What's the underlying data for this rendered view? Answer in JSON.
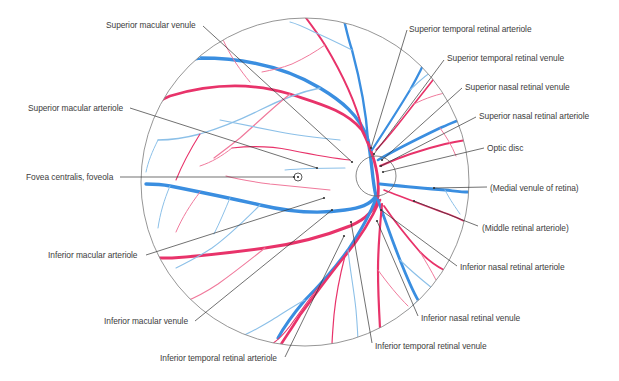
{
  "figure": {
    "fundus": {
      "cx": 305,
      "cy": 182,
      "r": 164,
      "stroke": "#8a8a8a"
    },
    "optic_disc": {
      "cx": 376,
      "cy": 176,
      "r": 20
    },
    "fovea": {
      "cx": 298,
      "cy": 177,
      "r": 4
    },
    "colors": {
      "arteriole": "#e8336a",
      "venule": "#3a8ee0",
      "venule_light": "#8cc0e8",
      "arteriole_light": "#f07a9c",
      "label_text": "#3d3d3d",
      "leader_line": "#333333"
    }
  },
  "labels": [
    {
      "id": "superior-macular-venule",
      "text": "Superior macular venule",
      "x": 106,
      "y": 20,
      "line": [
        [
          203,
          26
        ],
        [
          352,
          162
        ]
      ]
    },
    {
      "id": "superior-macular-arteriole",
      "text": "Superior macular arteriole",
      "x": 28,
      "y": 103,
      "line": [
        [
          130,
          108
        ],
        [
          317,
          168
        ]
      ]
    },
    {
      "id": "fovea-centralis",
      "text": "Fovea centralis, foveola",
      "x": 26,
      "y": 172,
      "line": [
        [
          120,
          177
        ],
        [
          294,
          177
        ]
      ]
    },
    {
      "id": "inferior-macular-arteriole",
      "text": "Inferior macular arteriole",
      "x": 48,
      "y": 250,
      "line": [
        [
          146,
          255
        ],
        [
          324,
          198
        ]
      ]
    },
    {
      "id": "inferior-macular-venule",
      "text": "Inferior macular venule",
      "x": 104,
      "y": 316,
      "line": [
        [
          195,
          321
        ],
        [
          332,
          210
        ]
      ]
    },
    {
      "id": "inferior-temporal-retinal-arteriole",
      "text": "Inferior temporal retinal arteriole",
      "x": 160,
      "y": 353,
      "line": [
        [
          285,
          357
        ],
        [
          344,
          236
        ]
      ]
    },
    {
      "id": "superior-temporal-retinal-arteriole",
      "text": "Superior temporal retinal arteriole",
      "x": 409,
      "y": 24,
      "line": [
        [
          407,
          30
        ],
        [
          371,
          148
        ]
      ]
    },
    {
      "id": "superior-temporal-retinal-venule",
      "text": "Superior temporal retinal venule",
      "x": 447,
      "y": 53,
      "line": [
        [
          444,
          60
        ],
        [
          374,
          154
        ]
      ]
    },
    {
      "id": "superior-nasal-retinal-venule",
      "text": "Superior nasal retinal venule",
      "x": 465,
      "y": 82,
      "line": [
        [
          462,
          88
        ],
        [
          382,
          160
        ]
      ]
    },
    {
      "id": "superior-nasal-retinal-arteriole",
      "text": "Superior nasal retinal arteriole",
      "x": 479,
      "y": 111,
      "line": [
        [
          476,
          117
        ],
        [
          381,
          166
        ]
      ]
    },
    {
      "id": "optic-disc",
      "text": "Optic disc",
      "x": 487,
      "y": 143,
      "line": [
        [
          484,
          148
        ],
        [
          383,
          172
        ]
      ]
    },
    {
      "id": "medial-venule-of-retina",
      "text": "(Medial venule of retina)",
      "x": 490,
      "y": 183,
      "line": [
        [
          487,
          187
        ],
        [
          434,
          188
        ]
      ]
    },
    {
      "id": "middle-retinal-arteriole",
      "text": "(Middle retinal arteriole)",
      "x": 482,
      "y": 223,
      "line": [
        [
          478,
          226
        ],
        [
          414,
          201
        ]
      ]
    },
    {
      "id": "inferior-nasal-retinal-arteriole",
      "text": "Inferior nasal retinal arteriole",
      "x": 460,
      "y": 262,
      "line": [
        [
          457,
          266
        ],
        [
          381,
          210
        ]
      ]
    },
    {
      "id": "inferior-nasal-retinal-venule",
      "text": "Inferior nasal retinal venule",
      "x": 421,
      "y": 313,
      "line": [
        [
          418,
          316
        ],
        [
          377,
          221
        ]
      ]
    },
    {
      "id": "inferior-temporal-retinal-venule",
      "text": "Inferior temporal retinal venule",
      "x": 375,
      "y": 341,
      "line": [
        [
          372,
          343
        ],
        [
          351,
          222
        ]
      ]
    }
  ],
  "vessels": [
    {
      "kind": "venule",
      "w": 3.4,
      "d": "M376 196 C372 180 372 160 368 140 C360 115 340 100 320 88 C290 70 250 58 200 58 C180 60 165 66 152 72"
    },
    {
      "kind": "arteriole",
      "w": 2.8,
      "d": "M378 196 C380 175 372 150 362 130 C345 110 320 104 290 94 C250 82 210 84 170 96 C160 100 152 106 146 112"
    },
    {
      "kind": "venule",
      "w": 2.4,
      "d": "M368 140 C366 110 360 80 352 50 C348 38 346 28 344 20"
    },
    {
      "kind": "arteriole",
      "w": 2.0,
      "d": "M362 128 C355 100 340 70 325 45 C318 34 312 26 306 18"
    },
    {
      "kind": "venule",
      "w": 2.2,
      "d": "M372 150 C385 130 398 110 410 90 C418 76 424 64 428 54"
    },
    {
      "kind": "venule",
      "w": 2.6,
      "d": "M378 160 C395 150 415 140 440 128 C450 124 458 120 464 118"
    },
    {
      "kind": "arteriole",
      "w": 2.0,
      "d": "M380 166 C398 158 420 150 445 144 C454 142 460 141 466 140"
    },
    {
      "kind": "arteriole",
      "w": 1.6,
      "d": "M376 150 C388 138 400 122 414 104 C422 94 430 84 436 76"
    },
    {
      "kind": "venule",
      "w": 2.8,
      "d": "M380 184 C400 186 420 188 445 190 C455 191 462 192 468 192"
    },
    {
      "kind": "arteriole",
      "w": 1.6,
      "d": "M384 190 C405 198 425 206 448 214 C456 217 462 220 466 222"
    },
    {
      "kind": "venule",
      "w": 3.4,
      "d": "M376 196 C370 205 360 208 345 210 C320 214 290 212 260 205 C230 198 200 192 170 186 C160 184 152 184 146 184"
    },
    {
      "kind": "arteriole",
      "w": 3.0,
      "d": "M378 196 C376 210 364 220 350 226 C325 236 295 244 265 248 C235 252 200 256 172 258 C162 258 154 258 148 258"
    },
    {
      "kind": "venule",
      "w": 3.0,
      "d": "M376 198 C370 215 360 232 348 250 C335 268 320 285 305 300 C295 312 285 325 278 338"
    },
    {
      "kind": "arteriole",
      "w": 2.6,
      "d": "M380 200 C372 218 360 238 345 256 C330 274 315 295 300 315 C292 328 285 338 280 346"
    },
    {
      "kind": "venule",
      "w": 2.8,
      "d": "M378 200 C385 220 392 240 400 260 C406 275 412 290 418 300"
    },
    {
      "kind": "arteriole",
      "w": 2.2,
      "d": "M382 204 C380 225 378 248 378 270 C378 290 379 310 380 328"
    },
    {
      "kind": "arteriole",
      "w": 1.8,
      "d": "M384 206 C395 222 408 238 420 252 C428 260 436 266 444 270"
    },
    {
      "kind": "venule_light",
      "w": 1.3,
      "d": "M320 88 C300 92 280 100 260 110 C240 120 220 128 200 134 C185 138 170 140 158 140"
    },
    {
      "kind": "arteriole_light",
      "w": 1.2,
      "d": "M290 94 C270 110 255 125 240 138 C230 146 222 152 214 158"
    },
    {
      "kind": "venule_light",
      "w": 1.2,
      "d": "M340 140 C320 138 300 136 280 132 C260 128 240 124 220 120"
    },
    {
      "kind": "arteriole",
      "w": 1.2,
      "d": "M350 160 C330 158 310 154 290 150 C270 146 250 146 232 148"
    },
    {
      "kind": "venule_light",
      "w": 1.1,
      "d": "M345 168 C325 168 305 168 285 170"
    },
    {
      "kind": "arteriole_light",
      "w": 1.1,
      "d": "M330 190 C310 188 290 186 270 184 C255 182 240 180 226 176"
    },
    {
      "kind": "venule_light",
      "w": 1.1,
      "d": "M260 205 C245 220 230 235 212 248 C200 256 188 262 176 268"
    },
    {
      "kind": "arteriole_light",
      "w": 1.1,
      "d": "M265 248 C250 260 235 272 218 284 C206 292 195 298 184 302"
    },
    {
      "kind": "venule_light",
      "w": 1.1,
      "d": "M305 300 C295 305 285 312 272 320 C262 326 252 332 242 336"
    },
    {
      "kind": "arteriole",
      "w": 1.2,
      "d": "M345 256 C340 275 336 295 334 315 C333 328 332 338 332 346"
    },
    {
      "kind": "venule_light",
      "w": 1.1,
      "d": "M348 250 C350 270 354 290 356 310 C357 322 358 334 358 344"
    },
    {
      "kind": "arteriole",
      "w": 1.1,
      "d": "M320 285 C310 298 300 312 290 326 C284 334 278 340 272 344"
    },
    {
      "kind": "venule_light",
      "w": 1.1,
      "d": "M400 260 C410 270 422 280 432 288"
    },
    {
      "kind": "arteriole_light",
      "w": 1.0,
      "d": "M378 270 C388 284 398 296 408 306"
    },
    {
      "kind": "venule_light",
      "w": 1.1,
      "d": "M352 50 C340 44 328 38 314 32 C306 28 298 24 290 22"
    },
    {
      "kind": "arteriole_light",
      "w": 1.0,
      "d": "M325 45 C315 52 305 58 292 64 C282 68 272 70 262 72"
    },
    {
      "kind": "venule_light",
      "w": 1.1,
      "d": "M410 90 C420 80 430 72 440 66 C446 62 452 60 456 58"
    },
    {
      "kind": "arteriole_light",
      "w": 1.0,
      "d": "M414 104 C426 98 438 94 450 92"
    },
    {
      "kind": "venule_light",
      "w": 1.0,
      "d": "M200 58 C190 48 182 40 176 34"
    },
    {
      "kind": "arteriole_light",
      "w": 1.0,
      "d": "M250 82 C240 70 232 58 226 46 C222 38 220 32 218 28"
    },
    {
      "kind": "venule_light",
      "w": 1.0,
      "d": "M170 186 C164 200 160 214 158 228"
    },
    {
      "kind": "arteriole_light",
      "w": 1.0,
      "d": "M200 192 C190 205 182 218 176 232"
    },
    {
      "kind": "venule_light",
      "w": 1.0,
      "d": "M230 198 C225 210 220 222 214 234"
    },
    {
      "kind": "arteriole",
      "w": 1.1,
      "d": "M200 134 C190 150 182 165 176 180"
    },
    {
      "kind": "venule_light",
      "w": 1.0,
      "d": "M158 140 C152 152 148 162 146 172"
    },
    {
      "kind": "arteriole_light",
      "w": 1.0,
      "d": "M232 148 C222 156 212 162 200 166"
    },
    {
      "kind": "arteriole_light",
      "w": 1.0,
      "d": "M440 128 C446 136 452 146 456 156"
    },
    {
      "kind": "venule_light",
      "w": 1.0,
      "d": "M445 190 C450 200 456 208 460 214"
    },
    {
      "kind": "arteriole_light",
      "w": 1.0,
      "d": "M420 252 C426 262 432 272 436 280"
    },
    {
      "kind": "venule_light",
      "w": 1.0,
      "d": "M418 300 C410 308 402 316 394 324"
    }
  ],
  "nodes": [
    [
      352,
      162
    ],
    [
      317,
      168
    ],
    [
      324,
      198
    ],
    [
      332,
      210
    ],
    [
      344,
      236
    ],
    [
      371,
      148
    ],
    [
      374,
      154
    ],
    [
      382,
      160
    ],
    [
      381,
      166
    ],
    [
      414,
      201
    ],
    [
      381,
      210
    ],
    [
      377,
      221
    ],
    [
      351,
      222
    ]
  ]
}
